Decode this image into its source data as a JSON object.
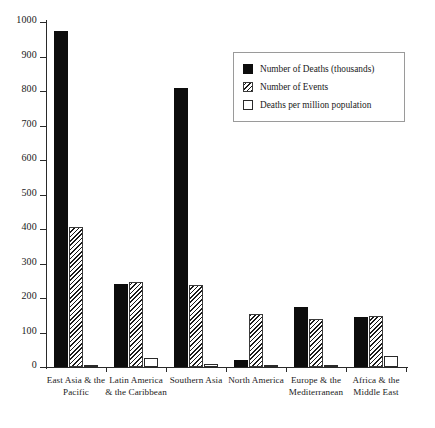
{
  "chart_data": {
    "type": "bar",
    "title": "",
    "subtitle": "",
    "xlabel": "",
    "ylabel": "",
    "ylim": [
      0,
      1000
    ],
    "ytick_labels": [
      "0",
      "100",
      "200",
      "300",
      "400",
      "500",
      "600",
      "700",
      "800",
      "900",
      "1000"
    ],
    "ytick_values": [
      0,
      100,
      200,
      300,
      400,
      500,
      600,
      700,
      800,
      900,
      1000
    ],
    "grid": false,
    "legend_position": "top-right",
    "categories": [
      "East Asia & the Pacific",
      "Latin America & the Caribbean",
      "Southern Asia",
      "North America",
      "Europe & the Mediterranean",
      "Africa & the Middle East"
    ],
    "category_lines": [
      [
        "East Asia & the",
        "Pacific"
      ],
      [
        "Latin America",
        "& the Caribbean"
      ],
      [
        "Southern Asia",
        ""
      ],
      [
        "North America",
        ""
      ],
      [
        "Europe & the",
        "Mediterranean"
      ],
      [
        "Africa & the",
        "Middle East"
      ]
    ],
    "series": [
      {
        "name": "Number of Deaths (thousands)",
        "style": "solid",
        "values": [
          975,
          242,
          810,
          20,
          175,
          145
        ]
      },
      {
        "name": "Number of Events",
        "style": "hatched",
        "values": [
          405,
          245,
          237,
          155,
          140,
          148
        ]
      },
      {
        "name": "Deaths per million population",
        "style": "open",
        "values": [
          6,
          25,
          8,
          5,
          3,
          32
        ]
      }
    ]
  },
  "legend": {
    "items": [
      {
        "label": "Number of Deaths (thousands)",
        "style": "solid"
      },
      {
        "label": "Number of Events",
        "style": "hatched"
      },
      {
        "label": "Deaths per million population",
        "style": "open"
      }
    ]
  }
}
